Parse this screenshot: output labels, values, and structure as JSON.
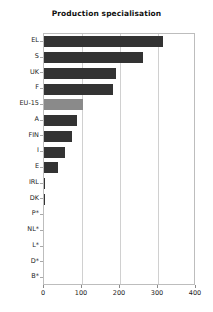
{
  "chart_data": {
    "type": "bar",
    "orientation": "horizontal",
    "title": "Production specialisation",
    "xlabel": "",
    "ylabel": "",
    "xlim": [
      0,
      400
    ],
    "xticks": [
      0,
      100,
      200,
      300,
      400
    ],
    "xtick_labels": [
      "0",
      "100",
      "200",
      "300",
      "400"
    ],
    "grid": true,
    "grid_axis": "x",
    "legend": false,
    "categories": [
      "EL",
      "S",
      "UK",
      "F",
      "EU-15",
      "A",
      "FIN",
      "I",
      "E",
      "IRL",
      "DK",
      "P*",
      "NL*",
      "L*",
      "D*",
      "B*"
    ],
    "values": [
      313,
      260,
      189,
      182,
      103,
      87,
      74,
      55,
      37,
      3,
      3,
      0,
      0,
      0,
      0,
      0
    ],
    "highlight_category": "EU-15",
    "colors": {
      "bar": "#333333",
      "highlight_bar": "#8a8a8a",
      "grid": "#d0d0d0",
      "axis": "#bdbdbd",
      "text": "#222222",
      "background": "#ffffff"
    }
  }
}
